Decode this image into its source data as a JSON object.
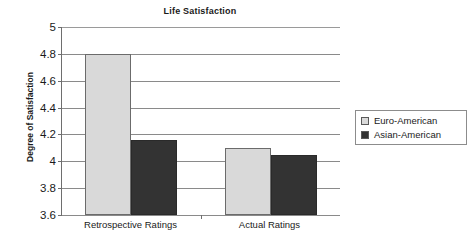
{
  "chart_data": {
    "type": "bar",
    "title": "Life Satisfaction",
    "xlabel": "",
    "ylabel": "Degree of Satisfaction",
    "categories": [
      "Retrospective Ratings",
      "Actual Ratings"
    ],
    "series": [
      {
        "name": "Euro-American",
        "values": [
          4.8,
          4.1
        ],
        "color": "#d9d9d9"
      },
      {
        "name": "Asian-American",
        "values": [
          4.16,
          4.05
        ],
        "color": "#333333"
      }
    ],
    "ylim": [
      3.6,
      5
    ],
    "ytick_labels": [
      "5",
      "4.8",
      "4.6",
      "4.4",
      "4.2",
      "4",
      "3.8",
      "3.6"
    ],
    "ytick_values": [
      5,
      4.8,
      4.6,
      4.4,
      4.2,
      4,
      3.8,
      3.6
    ],
    "grid": true,
    "legend_position": "right"
  },
  "legend": {
    "entries": [
      {
        "label": "Euro-American",
        "swatch": "#d9d9d9"
      },
      {
        "label": "Asian-American",
        "swatch": "#333333"
      }
    ]
  }
}
